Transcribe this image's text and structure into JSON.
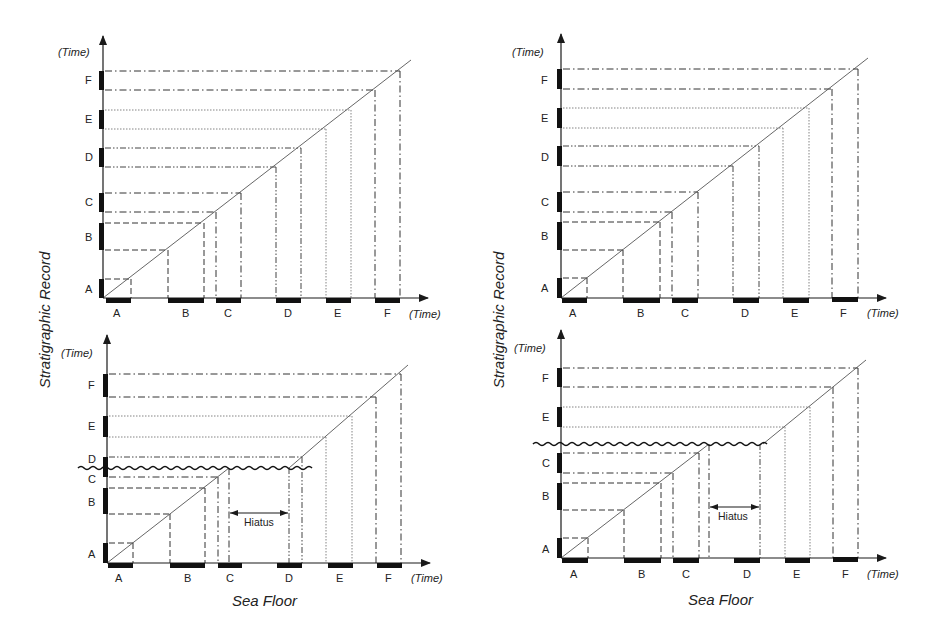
{
  "figure": {
    "y_axis_title": "Stratigraphic Record",
    "x_axis_title": "Sea Floor",
    "axis_time_label": "(Time)",
    "hiatus_label": "Hiatus",
    "units": [
      "A",
      "B",
      "C",
      "D",
      "E",
      "F"
    ]
  },
  "panels": [
    {
      "id": "top-left",
      "description": "Continuous deposition, left configuration",
      "has_hiatus": false,
      "sea_floor_units": [
        "A",
        "B",
        "C",
        "D",
        "E",
        "F"
      ],
      "strat_units": [
        "A",
        "B",
        "C",
        "D",
        "E",
        "F"
      ]
    },
    {
      "id": "top-right",
      "description": "Continuous deposition, right configuration",
      "has_hiatus": false,
      "sea_floor_units": [
        "A",
        "B",
        "C",
        "D",
        "E",
        "F"
      ],
      "strat_units": [
        "A",
        "B",
        "C",
        "D",
        "E",
        "F"
      ]
    },
    {
      "id": "bottom-left",
      "description": "Deposition with hiatus; part of C and D missing",
      "has_hiatus": true,
      "sea_floor_units": [
        "A",
        "B",
        "C",
        "D",
        "E",
        "F"
      ],
      "strat_units": [
        "A",
        "B",
        "C",
        "D",
        "E",
        "F"
      ]
    },
    {
      "id": "bottom-right",
      "description": "Deposition with hiatus; D missing entirely",
      "has_hiatus": true,
      "sea_floor_units": [
        "A",
        "B",
        "C",
        "D",
        "E",
        "F"
      ],
      "strat_units": [
        "A",
        "B",
        "C",
        "E",
        "F"
      ]
    }
  ]
}
